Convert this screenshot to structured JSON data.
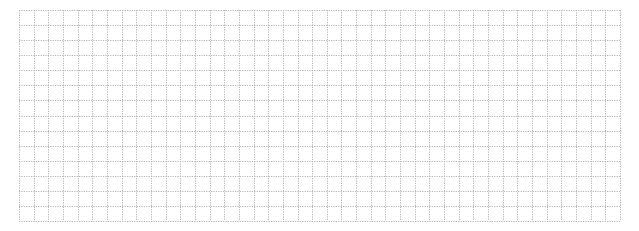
{
  "grid": {
    "left": 19,
    "top": 10,
    "width": 601,
    "height": 211,
    "columns": 41,
    "rows": 14,
    "line_color": "#b4b4b4",
    "line_style": "dotted",
    "background": "#ffffff"
  }
}
